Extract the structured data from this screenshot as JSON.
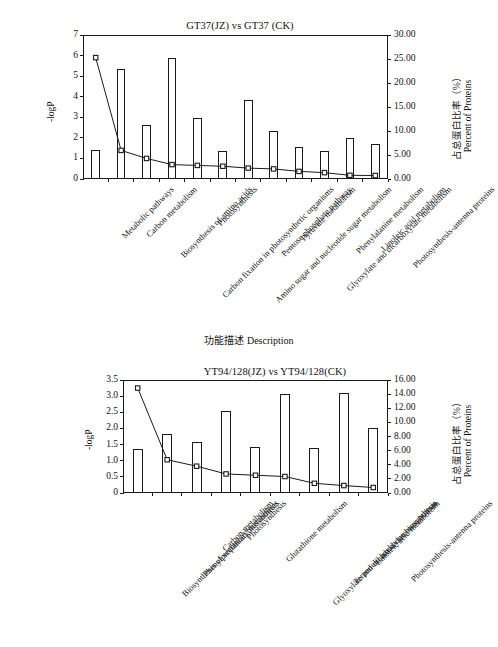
{
  "figure": {
    "x_axis_title": "功能描述 Description"
  },
  "chart_data": [
    {
      "type": "bar",
      "id": "top",
      "title": "GT37(JZ) vs GT37 (CK)",
      "xlabel": "功能描述 Description",
      "ylabel": "-logP",
      "y2label_cn": "占总蛋白比率（%）",
      "y2label_en": "Percent of Proteins",
      "ylim": [
        0,
        7
      ],
      "y2lim": [
        0,
        30
      ],
      "yticks": [
        "0",
        "1",
        "2",
        "3",
        "4",
        "5",
        "6",
        "7"
      ],
      "ytickvals": [
        0,
        1,
        2,
        3,
        4,
        5,
        6,
        7
      ],
      "y2ticks": [
        "0.00",
        "5.00",
        "10.00",
        "15.00",
        "20.00",
        "25.00",
        "30.00"
      ],
      "y2tickvals": [
        0,
        5,
        10,
        15,
        20,
        25,
        30
      ],
      "grid": false,
      "legend": "none",
      "categories": [
        "Metabolic pathways",
        "Carbon metabolism",
        "Biosynthesis of amino acids",
        "Carbon fixation in photosynthetic organisms",
        "Photosynthesis",
        "Amino sugar and nucleotide sugar metabolism",
        "Pentose phosphate pathway",
        "Pyruvate metabolism",
        "Glyoxylate and dicarboxylate metabolism",
        "Phenylalanine metabolism",
        "Linoleic acid metabolism",
        "Photosynthesis-antenna proteins"
      ],
      "series": [
        {
          "name": "Percent of Proteins",
          "axis": "right",
          "render": "bar",
          "values": [
            6.09,
            22.84,
            11.23,
            25.29,
            12.64,
            5.87,
            16.41,
            10.03,
            6.64,
            5.87,
            8.44,
            7.2
          ]
        },
        {
          "name": "-logP",
          "axis": "left",
          "render": "line",
          "values": [
            5.9,
            1.39,
            1.0,
            0.7,
            0.66,
            0.62,
            0.53,
            0.49,
            0.37,
            0.31,
            0.18,
            0.17
          ]
        }
      ]
    },
    {
      "type": "bar",
      "id": "bottom",
      "title": "YT94/128(JZ) vs YT94/128(CK)",
      "xlabel": "功能描述 Description",
      "ylabel": "-logP",
      "y2label_cn": "占总蛋白比率（%）",
      "y2label_en": "Percent of Proteins",
      "ylim": [
        0,
        3.5
      ],
      "y2lim": [
        0,
        16
      ],
      "yticks": [
        "0",
        "0.5",
        "1.0",
        "1.5",
        "2.0",
        "2.5",
        "3.0",
        "3.5"
      ],
      "ytickvals": [
        0,
        0.5,
        1.0,
        1.5,
        2.0,
        2.5,
        3.0,
        3.5
      ],
      "y2ticks": [
        "0.00",
        "2.00",
        "4.00",
        "6.00",
        "8.00",
        "10.00",
        "12.00",
        "14.00",
        "16.00"
      ],
      "y2tickvals": [
        0,
        2,
        4,
        6,
        8,
        10,
        12,
        14,
        16
      ],
      "grid": false,
      "legend": "none",
      "categories": [
        "Biosynthesis of secondary metabolites",
        "Phenylpropanoid biosynthesis",
        "Carbon metabolism",
        "Photosynthesis",
        "Glutathione metabolism",
        "Glyoxylate and dicarboxylate metabolism",
        "Terpenoid backbone biosynthesis",
        "Linoleic acid metabolism",
        "Photosynthesis-antenna proteins"
      ],
      "series": [
        {
          "name": "Percent of Proteins",
          "axis": "right",
          "render": "bar",
          "values": [
            6.17,
            8.37,
            7.22,
            11.57,
            6.49,
            14.08,
            6.4,
            14.12,
            9.14
          ]
        },
        {
          "name": "-logP",
          "axis": "left",
          "render": "line",
          "values": [
            3.25,
            1.03,
            0.83,
            0.59,
            0.55,
            0.51,
            0.3,
            0.23,
            0.17
          ]
        }
      ]
    }
  ]
}
